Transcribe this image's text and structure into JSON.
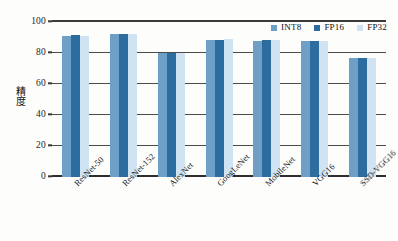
{
  "chart_data": {
    "type": "bar",
    "title": "",
    "xlabel": "",
    "ylabel": "精度",
    "ylim": [
      0,
      100
    ],
    "yticks": [
      0,
      20,
      40,
      60,
      80,
      100
    ],
    "grid": true,
    "legend_position": "top-right",
    "orientation": "vertical-grouped",
    "categories": [
      "ResNet-50",
      "ResNet-152",
      "AlexNet",
      "GoogLeNet",
      "MobileNet",
      "VGG16",
      "SSD-VGG16"
    ],
    "series": [
      {
        "name": "INT8",
        "color": "#6e9fc6",
        "values": [
          91.0,
          92.0,
          80.0,
          88.5,
          88.0,
          87.5,
          76.5
        ]
      },
      {
        "name": "FP16",
        "color": "#2c6c9f",
        "values": [
          91.5,
          92.0,
          80.3,
          88.7,
          88.2,
          88.0,
          77.0
        ]
      },
      {
        "name": "FP32",
        "color": "#cfe3f2",
        "values": [
          91.0,
          92.0,
          80.0,
          88.8,
          88.5,
          87.8,
          76.8
        ]
      }
    ]
  }
}
